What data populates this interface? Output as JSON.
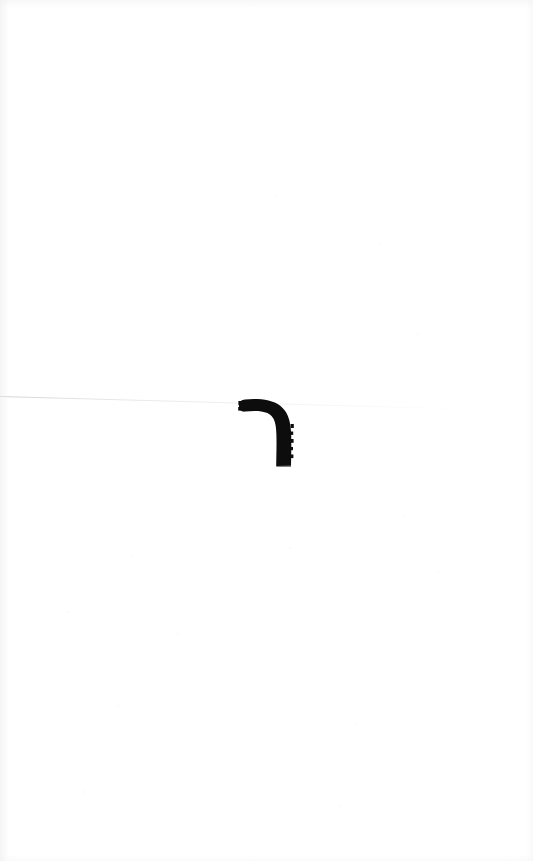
{
  "document": {
    "type": "scanned-page",
    "page_width": 533,
    "page_height": 861,
    "background_color": "#ffffff",
    "description": "Near-blank scanned document page"
  },
  "ink_mark": {
    "name": "hook-glyph",
    "label": "ר",
    "color": "#0d0d0d",
    "x": 236,
    "y": 398,
    "width": 62,
    "height": 70
  },
  "scan_line": {
    "name": "diagonal-scan-line",
    "color": "#c6c6cc",
    "start_x": 0,
    "start_y": 396,
    "end_x": 492,
    "end_y": 409
  },
  "ghost_text": {
    "color": "#fcfcfd",
    "top_left": "····  ··· ··",
    "top_mid": "·· ···· ·",
    "top_right": "···· ·· ···",
    "mid_right": "·· ···",
    "low_left": "· ··"
  }
}
